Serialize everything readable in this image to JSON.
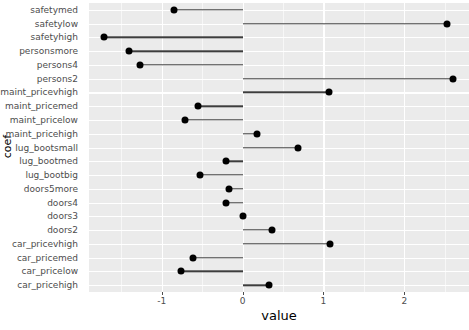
{
  "chart_data": {
    "type": "bar",
    "orientation": "horizontal",
    "style": "lollipop",
    "title": "",
    "xlabel": "value",
    "ylabel": "coef",
    "xlim": [
      -1.9,
      2.8
    ],
    "xticks": [
      -1,
      0,
      1,
      2
    ],
    "xtick_labels": [
      "-1",
      "0",
      "1",
      "2"
    ],
    "grid": true,
    "baseline": 0,
    "legend": "none",
    "categories": [
      "safetymed",
      "safetylow",
      "safetyhigh",
      "personsmore",
      "persons4",
      "persons2",
      "maint_pricevhigh",
      "maint_pricemed",
      "maint_pricelow",
      "maint_pricehigh",
      "lug_bootsmall",
      "lug_bootmed",
      "lug_bootbig",
      "doors5more",
      "doors4",
      "doors3",
      "doors2",
      "car_pricevhigh",
      "car_pricemed",
      "car_pricelow",
      "car_pricehigh"
    ],
    "values": [
      -0.85,
      2.53,
      -1.72,
      -1.4,
      -1.27,
      2.6,
      1.07,
      -0.55,
      -0.71,
      0.18,
      0.69,
      -0.2,
      -0.53,
      -0.17,
      -0.2,
      0.01,
      0.36,
      1.08,
      -0.61,
      -0.76,
      0.33
    ]
  },
  "axes": {
    "x_title": "value",
    "y_title": "coef"
  },
  "colors": {
    "panel_background": "#ebebeb",
    "grid_major": "#ffffff",
    "point": "#000000",
    "segment": "#3d3d3d",
    "tick_text": "#4d4d4d",
    "page_background": "#ffffff"
  }
}
